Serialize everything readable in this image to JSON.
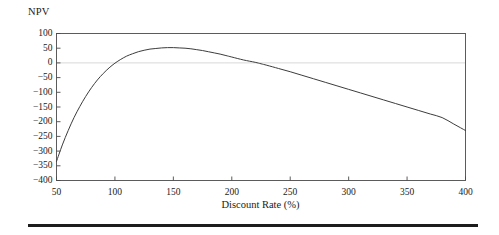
{
  "figure": {
    "y_axis_title": "NPV",
    "x_axis_title": "Discount Rate (%)"
  },
  "chart_data": {
    "type": "line",
    "title": "",
    "subtitle": "",
    "xlabel": "Discount Rate (%)",
    "ylabel": "NPV",
    "xlim": [
      50,
      400
    ],
    "ylim": [
      -400,
      100
    ],
    "xticks": [
      50,
      100,
      150,
      200,
      250,
      300,
      350,
      400
    ],
    "xtick_labels": [
      "50",
      "100",
      "150",
      "200",
      "250",
      "300",
      "350",
      "400"
    ],
    "yticks": [
      100,
      50,
      0,
      -50,
      -100,
      -150,
      -200,
      -250,
      -300,
      -350,
      -400
    ],
    "ytick_labels": [
      "100",
      "50",
      "0",
      "−50",
      "−100",
      "−150",
      "−200",
      "−250",
      "−300",
      "−350",
      "−400"
    ],
    "grid": false,
    "zero_reference_line": {
      "value": 0,
      "color": "#d8d8d8",
      "visible": true
    },
    "legend": null,
    "line_color": "#3c3c3c",
    "line_width": 1,
    "series": [
      {
        "name": "NPV",
        "x": [
          50,
          55,
          60,
          65,
          70,
          75,
          80,
          85,
          90,
          95,
          100,
          105,
          110,
          115,
          120,
          125,
          130,
          135,
          140,
          145,
          150,
          155,
          160,
          165,
          170,
          175,
          180,
          185,
          190,
          195,
          200,
          210,
          220,
          225,
          230,
          240,
          250,
          260,
          270,
          280,
          290,
          300,
          310,
          320,
          330,
          340,
          350,
          360,
          370,
          380,
          390,
          400
        ],
        "y": [
          -335,
          -279,
          -230,
          -186,
          -148,
          -114,
          -84,
          -58,
          -36,
          -17,
          -1,
          12,
          23,
          31,
          38,
          43,
          47,
          49,
          51,
          52,
          52,
          51,
          50,
          48,
          45,
          42,
          38,
          34,
          30,
          25,
          20,
          10,
          2,
          -3,
          -8,
          -19,
          -30,
          -42,
          -54,
          -66,
          -78,
          -90,
          -102,
          -114,
          -126,
          -138,
          -150,
          -162,
          -174,
          -186,
          -208,
          -230
        ]
      }
    ],
    "annotations": {
      "zero_crossings": [
        100,
        222
      ],
      "peak": {
        "x": 148,
        "y": 52
      },
      "start": {
        "x": 50,
        "y": -335
      },
      "end": {
        "x": 400,
        "y": -230
      }
    },
    "frame": {
      "visible": true,
      "color": "#4a4a4a"
    }
  },
  "decor": {
    "bottom_rule_color": "#1c1c1c"
  }
}
